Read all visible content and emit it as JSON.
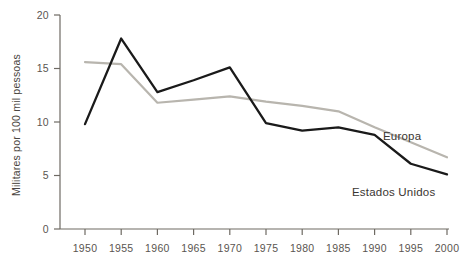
{
  "chart_data": {
    "type": "line",
    "title": "",
    "subtitle": "",
    "xlabel": "",
    "ylabel": "Militares por 100 mil pessoas",
    "x": [
      1950,
      1955,
      1960,
      1965,
      1970,
      1975,
      1980,
      1985,
      1990,
      1995,
      2000
    ],
    "xticklabels": [
      "1950",
      "1955",
      "1960",
      "1965",
      "1970",
      "1975",
      "1980",
      "1985",
      "1990",
      "1995",
      "2000"
    ],
    "yticks": [
      0,
      5,
      10,
      15,
      20
    ],
    "yticklabels": [
      "0",
      "5",
      "10",
      "15",
      "20"
    ],
    "xlim": [
      1950,
      2000
    ],
    "ylim": [
      0,
      20
    ],
    "grid": false,
    "legend_position": "inline-right",
    "series": [
      {
        "name": "Estados Unidos",
        "color": "#1a1a1a",
        "values": [
          9.8,
          17.8,
          12.8,
          13.9,
          15.1,
          9.9,
          9.2,
          9.5,
          8.8,
          6.1,
          5.1
        ]
      },
      {
        "name": "Europa",
        "color": "#b8b5ae",
        "values": [
          15.6,
          15.4,
          11.8,
          12.1,
          12.4,
          11.9,
          11.5,
          11.0,
          9.5,
          8.1,
          6.7
        ]
      }
    ],
    "annotations": [
      {
        "text": "Europa",
        "x": 2000,
        "y": 9.2
      },
      {
        "text": "Estados Unidos",
        "x": 1993,
        "y": 4.3
      }
    ],
    "colors": {
      "axis": "#6e6a63",
      "tick_text": "#5a5550",
      "label_text": "#3a3632",
      "background": "#ffffff",
      "series_us": "#1a1a1a",
      "series_eu": "#b8b5ae"
    }
  }
}
